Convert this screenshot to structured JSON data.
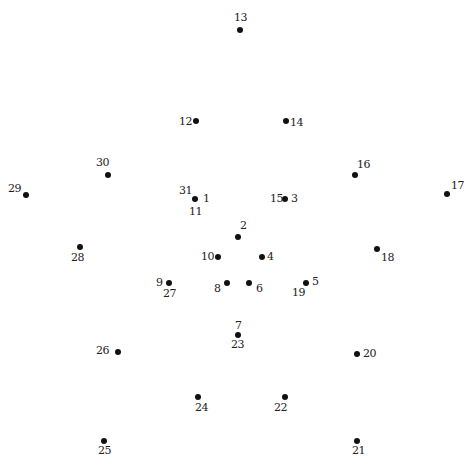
{
  "puzzle": {
    "type": "connect-the-dots",
    "points": [
      {
        "x": 195,
        "y": 199,
        "labels": [
          {
            "text": "1",
            "dx": 8,
            "dy": -6
          },
          {
            "text": "31",
            "dx": -16,
            "dy": -14
          },
          {
            "text": "11",
            "dx": -6,
            "dy": 7
          }
        ]
      },
      {
        "x": 238,
        "y": 237,
        "labels": [
          {
            "text": "2",
            "dx": 2,
            "dy": -17
          }
        ]
      },
      {
        "x": 285,
        "y": 199,
        "labels": [
          {
            "text": "3",
            "dx": 6,
            "dy": -6
          },
          {
            "text": "15",
            "dx": -15,
            "dy": -6
          }
        ]
      },
      {
        "x": 262,
        "y": 257,
        "labels": [
          {
            "text": "4",
            "dx": 5,
            "dy": -6
          }
        ]
      },
      {
        "x": 306,
        "y": 283,
        "labels": [
          {
            "text": "5",
            "dx": 6,
            "dy": -7
          },
          {
            "text": "19",
            "dx": -14,
            "dy": 4
          }
        ]
      },
      {
        "x": 249,
        "y": 283,
        "labels": [
          {
            "text": "6",
            "dx": 7,
            "dy": 0
          }
        ]
      },
      {
        "x": 227,
        "y": 283,
        "labels": [
          {
            "text": "8",
            "dx": -13,
            "dy": 0
          }
        ]
      },
      {
        "x": 238,
        "y": 335,
        "labels": [
          {
            "text": "7",
            "dx": -3,
            "dy": -15
          },
          {
            "text": "23",
            "dx": -7,
            "dy": 4
          }
        ]
      },
      {
        "x": 169,
        "y": 283,
        "labels": [
          {
            "text": "9",
            "dx": -13,
            "dy": -6
          },
          {
            "text": "27",
            "dx": -6,
            "dy": 5
          }
        ]
      },
      {
        "x": 218,
        "y": 257,
        "labels": [
          {
            "text": "10",
            "dx": -17,
            "dy": -6
          }
        ]
      },
      {
        "x": 196,
        "y": 121,
        "labels": [
          {
            "text": "12",
            "dx": -17,
            "dy": -5
          }
        ]
      },
      {
        "x": 240,
        "y": 30,
        "labels": [
          {
            "text": "13",
            "dx": -6,
            "dy": -18
          }
        ]
      },
      {
        "x": 286,
        "y": 121,
        "labels": [
          {
            "text": "14",
            "dx": 4,
            "dy": -4
          }
        ]
      },
      {
        "x": 355,
        "y": 175,
        "labels": [
          {
            "text": "16",
            "dx": 2,
            "dy": -16
          }
        ]
      },
      {
        "x": 447,
        "y": 194,
        "labels": [
          {
            "text": "17",
            "dx": 4,
            "dy": -14
          }
        ]
      },
      {
        "x": 377,
        "y": 249,
        "labels": [
          {
            "text": "18",
            "dx": 4,
            "dy": 3
          }
        ]
      },
      {
        "x": 357,
        "y": 354,
        "labels": [
          {
            "text": "20",
            "dx": 6,
            "dy": -6
          }
        ]
      },
      {
        "x": 357,
        "y": 441,
        "labels": [
          {
            "text": "21",
            "dx": -5,
            "dy": 4
          }
        ]
      },
      {
        "x": 285,
        "y": 397,
        "labels": [
          {
            "text": "22",
            "dx": -11,
            "dy": 5
          }
        ]
      },
      {
        "x": 198,
        "y": 397,
        "labels": [
          {
            "text": "24",
            "dx": -3,
            "dy": 5
          }
        ]
      },
      {
        "x": 104,
        "y": 441,
        "labels": [
          {
            "text": "25",
            "dx": -6,
            "dy": 4
          }
        ]
      },
      {
        "x": 118,
        "y": 352,
        "labels": [
          {
            "text": "26",
            "dx": -22,
            "dy": -7
          }
        ]
      },
      {
        "x": 80,
        "y": 247,
        "labels": [
          {
            "text": "28",
            "dx": -9,
            "dy": 5
          }
        ]
      },
      {
        "x": 26,
        "y": 195,
        "labels": [
          {
            "text": "29",
            "dx": -18,
            "dy": -12
          }
        ]
      },
      {
        "x": 108,
        "y": 175,
        "labels": [
          {
            "text": "30",
            "dx": -12,
            "dy": -18
          }
        ]
      }
    ]
  }
}
